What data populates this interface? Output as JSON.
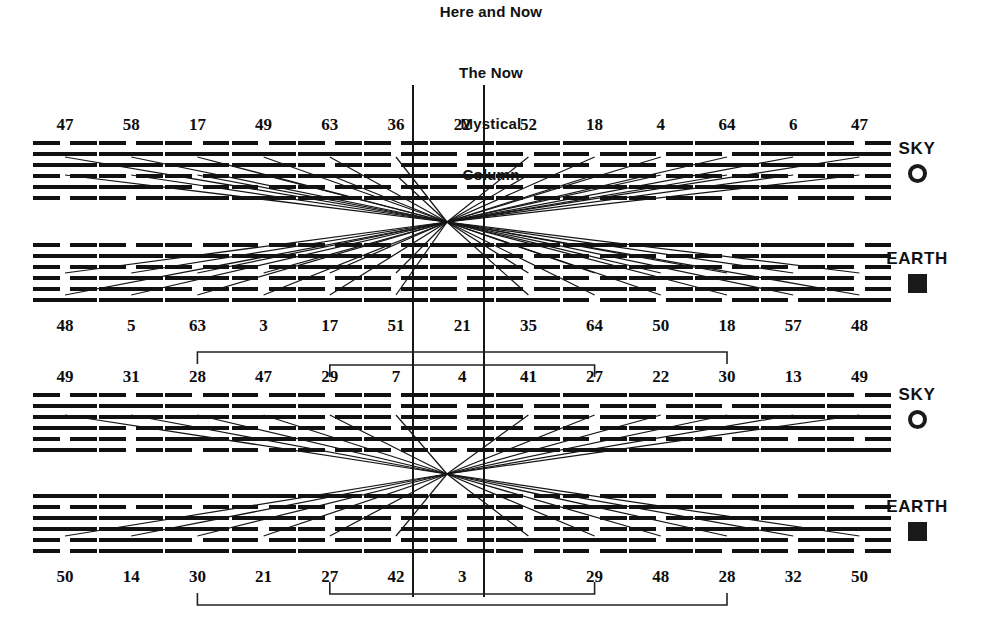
{
  "headings": {
    "here_and_now": "Here and Now",
    "the_now": "The Now",
    "mystical": "Mystical",
    "column": "Column"
  },
  "legend": {
    "sky_label": "SKY",
    "earth_label": "EARTH",
    "sky_icon": "circle-outline-icon",
    "earth_icon": "filled-square-icon",
    "items": [
      {
        "label": "SKY",
        "icon": "circle-outline-icon",
        "row": 1
      },
      {
        "label": "EARTH",
        "icon": "filled-square-icon",
        "row": 2
      },
      {
        "label": "SKY",
        "icon": "circle-outline-icon",
        "row": 3
      },
      {
        "label": "EARTH",
        "icon": "filled-square-icon",
        "row": 4
      }
    ]
  },
  "colors": {
    "ink": "#111111",
    "background": "#ffffff",
    "line": "#161616"
  },
  "chart_data": {
    "type": "diagram",
    "columns": 13,
    "rows": [
      {
        "name": "upper-sky",
        "band": "SKY",
        "label_position": "above",
        "numbers": [
          47,
          58,
          17,
          49,
          63,
          36,
          22,
          52,
          18,
          4,
          64,
          6,
          47
        ],
        "hexagrams": [
          {
            "number": 47,
            "lines": [
              "broken",
              "solid",
              "solid",
              "broken",
              "solid",
              "broken"
            ]
          },
          {
            "number": 58,
            "lines": [
              "broken",
              "solid",
              "solid",
              "broken",
              "solid",
              "broken"
            ]
          },
          {
            "number": 17,
            "lines": [
              "broken",
              "solid",
              "solid",
              "broken",
              "broken",
              "solid"
            ]
          },
          {
            "number": 49,
            "lines": [
              "broken",
              "solid",
              "solid",
              "solid",
              "broken",
              "solid"
            ]
          },
          {
            "number": 63,
            "lines": [
              "broken",
              "solid",
              "broken",
              "solid",
              "broken",
              "solid"
            ]
          },
          {
            "number": 36,
            "lines": [
              "broken",
              "broken",
              "broken",
              "solid",
              "broken",
              "solid"
            ]
          },
          {
            "number": 22,
            "lines": [
              "solid",
              "broken",
              "broken",
              "solid",
              "broken",
              "solid"
            ]
          },
          {
            "number": 52,
            "lines": [
              "solid",
              "broken",
              "broken",
              "solid",
              "broken",
              "broken"
            ]
          },
          {
            "number": 18,
            "lines": [
              "solid",
              "broken",
              "broken",
              "solid",
              "solid",
              "broken"
            ]
          },
          {
            "number": 4,
            "lines": [
              "solid",
              "broken",
              "broken",
              "broken",
              "solid",
              "broken"
            ]
          },
          {
            "number": 64,
            "lines": [
              "solid",
              "broken",
              "solid",
              "broken",
              "solid",
              "broken"
            ]
          },
          {
            "number": 6,
            "lines": [
              "solid",
              "solid",
              "solid",
              "broken",
              "solid",
              "broken"
            ]
          },
          {
            "number": 47,
            "lines": [
              "broken",
              "solid",
              "solid",
              "broken",
              "solid",
              "broken"
            ]
          }
        ]
      },
      {
        "name": "upper-earth",
        "band": "EARTH",
        "label_position": "below",
        "numbers": [
          48,
          5,
          63,
          3,
          17,
          51,
          21,
          35,
          64,
          50,
          18,
          57,
          48
        ],
        "hexagrams": [
          {
            "number": 48,
            "lines": [
              "broken",
              "solid",
              "broken",
              "broken",
              "broken",
              "solid"
            ]
          },
          {
            "number": 5,
            "lines": [
              "broken",
              "solid",
              "broken",
              "solid",
              "solid",
              "solid"
            ]
          },
          {
            "number": 63,
            "lines": [
              "broken",
              "solid",
              "broken",
              "solid",
              "broken",
              "solid"
            ]
          },
          {
            "number": 3,
            "lines": [
              "broken",
              "solid",
              "broken",
              "broken",
              "broken",
              "solid"
            ]
          },
          {
            "number": 17,
            "lines": [
              "broken",
              "solid",
              "solid",
              "broken",
              "broken",
              "solid"
            ]
          },
          {
            "number": 51,
            "lines": [
              "broken",
              "broken",
              "solid",
              "broken",
              "broken",
              "solid"
            ]
          },
          {
            "number": 21,
            "lines": [
              "solid",
              "broken",
              "solid",
              "broken",
              "broken",
              "solid"
            ]
          },
          {
            "number": 35,
            "lines": [
              "solid",
              "broken",
              "broken",
              "broken",
              "broken",
              "solid"
            ]
          },
          {
            "number": 64,
            "lines": [
              "solid",
              "broken",
              "solid",
              "broken",
              "solid",
              "broken"
            ]
          },
          {
            "number": 50,
            "lines": [
              "solid",
              "broken",
              "solid",
              "solid",
              "broken",
              "broken"
            ]
          },
          {
            "number": 18,
            "lines": [
              "solid",
              "broken",
              "broken",
              "solid",
              "solid",
              "broken"
            ]
          },
          {
            "number": 57,
            "lines": [
              "solid",
              "solid",
              "broken",
              "solid",
              "solid",
              "broken"
            ]
          },
          {
            "number": 48,
            "lines": [
              "broken",
              "solid",
              "broken",
              "broken",
              "broken",
              "solid"
            ]
          }
        ]
      },
      {
        "name": "lower-sky",
        "band": "SKY",
        "label_position": "above",
        "numbers": [
          49,
          31,
          28,
          47,
          29,
          7,
          4,
          41,
          27,
          22,
          30,
          13,
          49
        ],
        "hexagrams": [
          {
            "number": 49,
            "lines": [
              "broken",
              "solid",
              "solid",
              "solid",
              "broken",
              "solid"
            ]
          },
          {
            "number": 31,
            "lines": [
              "broken",
              "solid",
              "solid",
              "broken",
              "broken",
              "broken"
            ]
          },
          {
            "number": 28,
            "lines": [
              "broken",
              "solid",
              "solid",
              "solid",
              "solid",
              "broken"
            ]
          },
          {
            "number": 47,
            "lines": [
              "broken",
              "solid",
              "solid",
              "broken",
              "solid",
              "broken"
            ]
          },
          {
            "number": 29,
            "lines": [
              "broken",
              "solid",
              "broken",
              "broken",
              "solid",
              "broken"
            ]
          },
          {
            "number": 7,
            "lines": [
              "broken",
              "broken",
              "broken",
              "broken",
              "solid",
              "broken"
            ]
          },
          {
            "number": 4,
            "lines": [
              "solid",
              "broken",
              "broken",
              "broken",
              "solid",
              "broken"
            ]
          },
          {
            "number": 41,
            "lines": [
              "solid",
              "broken",
              "broken",
              "broken",
              "solid",
              "solid"
            ]
          },
          {
            "number": 27,
            "lines": [
              "solid",
              "broken",
              "broken",
              "broken",
              "broken",
              "solid"
            ]
          },
          {
            "number": 22,
            "lines": [
              "solid",
              "broken",
              "broken",
              "solid",
              "broken",
              "solid"
            ]
          },
          {
            "number": 30,
            "lines": [
              "solid",
              "broken",
              "solid",
              "solid",
              "broken",
              "solid"
            ]
          },
          {
            "number": 13,
            "lines": [
              "solid",
              "solid",
              "solid",
              "solid",
              "broken",
              "solid"
            ]
          },
          {
            "number": 49,
            "lines": [
              "broken",
              "solid",
              "solid",
              "solid",
              "broken",
              "solid"
            ]
          }
        ]
      },
      {
        "name": "lower-earth",
        "band": "EARTH",
        "label_position": "below",
        "numbers": [
          50,
          14,
          30,
          21,
          27,
          42,
          3,
          8,
          29,
          48,
          28,
          32,
          50
        ],
        "hexagrams": [
          {
            "number": 50,
            "lines": [
              "solid",
              "broken",
              "solid",
              "solid",
              "broken",
              "broken"
            ]
          },
          {
            "number": 14,
            "lines": [
              "solid",
              "broken",
              "solid",
              "solid",
              "solid",
              "solid"
            ]
          },
          {
            "number": 30,
            "lines": [
              "solid",
              "broken",
              "solid",
              "solid",
              "broken",
              "solid"
            ]
          },
          {
            "number": 21,
            "lines": [
              "solid",
              "broken",
              "solid",
              "broken",
              "broken",
              "solid"
            ]
          },
          {
            "number": 27,
            "lines": [
              "solid",
              "broken",
              "broken",
              "broken",
              "broken",
              "solid"
            ]
          },
          {
            "number": 42,
            "lines": [
              "solid",
              "solid",
              "broken",
              "broken",
              "broken",
              "solid"
            ]
          },
          {
            "number": 3,
            "lines": [
              "broken",
              "solid",
              "broken",
              "broken",
              "broken",
              "solid"
            ]
          },
          {
            "number": 8,
            "lines": [
              "broken",
              "broken",
              "broken",
              "broken",
              "solid",
              "broken"
            ]
          },
          {
            "number": 29,
            "lines": [
              "broken",
              "solid",
              "broken",
              "broken",
              "solid",
              "broken"
            ]
          },
          {
            "number": 48,
            "lines": [
              "broken",
              "solid",
              "broken",
              "broken",
              "broken",
              "solid"
            ]
          },
          {
            "number": 28,
            "lines": [
              "broken",
              "solid",
              "solid",
              "solid",
              "solid",
              "broken"
            ]
          },
          {
            "number": 32,
            "lines": [
              "broken",
              "solid",
              "solid",
              "solid",
              "broken",
              "broken"
            ]
          },
          {
            "number": 50,
            "lines": [
              "solid",
              "broken",
              "solid",
              "solid",
              "broken",
              "broken"
            ]
          }
        ]
      }
    ],
    "brackets": [
      {
        "name": "upper-outer-bracket",
        "from_column": 3,
        "to_column": 11,
        "from_value": 28,
        "to_value": 30,
        "position": "above-lower-sky"
      },
      {
        "name": "upper-inner-bracket",
        "from_column": 5,
        "to_column": 9,
        "from_value": 29,
        "to_value": 27,
        "position": "above-lower-sky"
      },
      {
        "name": "lower-outer-bracket",
        "from_column": 3,
        "to_column": 11,
        "from_value": 30,
        "to_value": 28,
        "position": "below-lower-earth"
      },
      {
        "name": "lower-inner-bracket",
        "from_column": 5,
        "to_column": 9,
        "from_value": 27,
        "to_value": 29,
        "position": "below-lower-earth"
      }
    ],
    "mystical_column": {
      "left_line_column": 7,
      "right_line_column": 7,
      "label": "The Now Mystical Column"
    }
  }
}
